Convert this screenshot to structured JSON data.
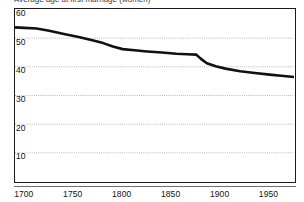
{
  "caption": {
    "text": "Average age at first marriage (women)"
  },
  "axes": {
    "y_ticks": [
      60,
      50,
      40,
      30,
      20,
      10
    ],
    "x_ticks": [
      1700,
      1750,
      1800,
      1850,
      1900,
      1950
    ]
  },
  "chart_data": {
    "type": "line",
    "title": "",
    "xlabel": "",
    "ylabel": "",
    "xlim": [
      1690,
      1975
    ],
    "ylim": [
      0,
      60
    ],
    "grid": true,
    "legend": null,
    "series": [
      {
        "name": "series-1",
        "color": "#111111",
        "x": [
          1690,
          1700,
          1712,
          1725,
          1740,
          1755,
          1768,
          1780,
          1790,
          1800,
          1812,
          1825,
          1840,
          1855,
          1866,
          1875,
          1880,
          1886,
          1895,
          1905,
          1920,
          1935,
          1950,
          1962,
          1975
        ],
        "y": [
          53.6,
          53.4,
          53.2,
          52.4,
          51.3,
          50.2,
          49.2,
          48.1,
          46.9,
          46.0,
          45.6,
          45.2,
          44.8,
          44.4,
          44.2,
          44.1,
          42.6,
          41.1,
          40.0,
          39.2,
          38.3,
          37.7,
          37.1,
          36.7,
          36.3
        ]
      }
    ]
  }
}
